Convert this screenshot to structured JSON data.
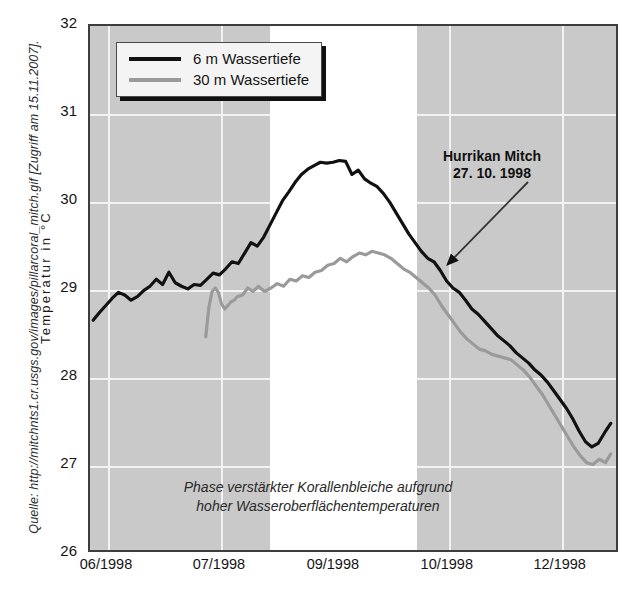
{
  "figure": {
    "title_sliver": "",
    "source_credit": "Quelle: http://mitchnts1.cr.usgs.gov/images/pillarcoral_mitch.gif [Zugriff am 15.11.2007].",
    "y_axis_title": "Temperatur in °C",
    "plot_caption_line1": "Phase verstärkter Korallenbleiche aufgrund",
    "plot_caption_line2": "hoher Wasseroberflächentemperaturen",
    "annotation_line1": "Hurrikan Mitch",
    "annotation_line2": "27. 10. 1998"
  },
  "colors": {
    "plot_background": "#c9c9c9",
    "highlight_band": "#ffffff",
    "gridline": "#f2f2f2",
    "series_6m": "#111111",
    "series_30m": "#9a9a9a",
    "axis_frame": "#3d3d3d",
    "text": "#141414"
  },
  "legend": {
    "position": "top-left-inside",
    "entries": [
      {
        "label": "6 m Wassertiefe",
        "color": "#111111",
        "swatch": "line-swatch-black"
      },
      {
        "label": "30 m Wassertiefe",
        "color": "#9a9a9a",
        "swatch": "line-swatch-gray"
      }
    ]
  },
  "chart_data": {
    "type": "line",
    "title": "",
    "xlabel": "",
    "ylabel": "Temperatur in °C",
    "ylim": [
      26,
      32
    ],
    "yticks": [
      26,
      27,
      28,
      29,
      30,
      31,
      32
    ],
    "xlim": [
      0,
      100
    ],
    "xticks": [
      3.4,
      24.7,
      46.2,
      67.7,
      89.0
    ],
    "xticklabels": [
      "06/1998",
      "07/1998",
      "09/1998",
      "10/1998",
      "12/1998"
    ],
    "grid": true,
    "legend_position": "upper left",
    "annotations": [
      {
        "text": "Hurrikan Mitch\n27. 10. 1998",
        "x": 69.0,
        "y": 30.55,
        "arrow_to_x": 65.5,
        "arrow_to_y": 29.35
      },
      {
        "text": "Phase verstärkter Korallenbleiche aufgrund\nhoher Wasseroberflächentemperaturen",
        "x": 40.0,
        "y": 26.55
      }
    ],
    "shaded_regions": [
      {
        "x_start": 34.0,
        "x_end": 61.7,
        "color": "#ffffff",
        "label": "Phase verstärkter Korallenbleiche"
      }
    ],
    "series": [
      {
        "name": "6 m Wassertiefe",
        "color": "#111111",
        "x": [
          0.6,
          1.8,
          3.0,
          4.2,
          5.4,
          6.6,
          7.8,
          9.0,
          10.2,
          11.4,
          12.6,
          13.8,
          15.0,
          16.2,
          17.4,
          18.6,
          19.8,
          21.0,
          22.2,
          23.4,
          24.6,
          25.8,
          27.0,
          28.2,
          29.4,
          30.6,
          31.8,
          33.0,
          34.2,
          35.4,
          36.6,
          37.8,
          39.0,
          40.2,
          41.4,
          42.6,
          43.8,
          45.0,
          46.2,
          47.4,
          48.6,
          49.8,
          51.0,
          52.2,
          53.4,
          54.6,
          55.8,
          57.0,
          58.2,
          59.4,
          60.6,
          61.8,
          63.0,
          64.2,
          65.4,
          66.6,
          67.8,
          69.0,
          70.2,
          71.4,
          72.6,
          73.8,
          75.0,
          76.2,
          77.4,
          78.6,
          79.8,
          81.0,
          82.2,
          83.4,
          84.6,
          85.8,
          87.0,
          88.2,
          89.4,
          90.6,
          91.8,
          93.0,
          94.2,
          95.4,
          96.6,
          97.8,
          99.0
        ],
        "y": [
          28.63,
          28.72,
          28.8,
          28.88,
          28.95,
          28.92,
          28.86,
          28.9,
          28.97,
          29.02,
          29.1,
          29.04,
          29.18,
          29.06,
          29.02,
          28.99,
          29.04,
          29.03,
          29.1,
          29.17,
          29.15,
          29.22,
          29.3,
          29.28,
          29.4,
          29.52,
          29.48,
          29.58,
          29.72,
          29.86,
          30.0,
          30.1,
          30.21,
          30.3,
          30.36,
          30.4,
          30.44,
          30.43,
          30.44,
          30.46,
          30.45,
          30.3,
          30.35,
          30.25,
          30.2,
          30.16,
          30.08,
          29.98,
          29.86,
          29.74,
          29.62,
          29.52,
          29.42,
          29.34,
          29.3,
          29.2,
          29.08,
          29.0,
          28.95,
          28.86,
          28.76,
          28.7,
          28.62,
          28.54,
          28.46,
          28.4,
          28.34,
          28.26,
          28.2,
          28.14,
          28.06,
          28.0,
          27.92,
          27.82,
          27.72,
          27.62,
          27.5,
          27.36,
          27.24,
          27.18,
          27.22,
          27.34,
          27.45
        ]
      },
      {
        "name": "30 m Wassertiefe",
        "color": "#9a9a9a",
        "x": [
          22.0,
          22.6,
          23.2,
          23.8,
          24.4,
          25.0,
          25.6,
          26.2,
          26.8,
          27.4,
          28.0,
          29.0,
          30.0,
          31.0,
          32.0,
          33.2,
          34.4,
          35.6,
          36.8,
          38.0,
          39.2,
          40.4,
          41.6,
          42.8,
          44.0,
          45.2,
          46.4,
          47.6,
          48.8,
          50.0,
          51.2,
          52.4,
          53.6,
          54.8,
          56.0,
          57.2,
          58.4,
          59.6,
          60.8,
          62.0,
          63.2,
          64.4,
          65.6,
          66.8,
          68.0,
          69.2,
          70.4,
          71.6,
          72.8,
          74.0,
          75.2,
          76.4,
          77.6,
          78.8,
          80.0,
          81.2,
          82.4,
          83.6,
          84.8,
          86.0,
          87.2,
          88.4,
          89.6,
          90.8,
          92.0,
          93.2,
          94.4,
          95.6,
          96.8,
          98.0,
          99.0
        ],
        "y": [
          28.44,
          28.78,
          28.96,
          29.0,
          28.95,
          28.82,
          28.76,
          28.8,
          28.84,
          28.86,
          28.9,
          28.92,
          29.0,
          28.96,
          29.02,
          28.96,
          29.0,
          29.05,
          29.02,
          29.1,
          29.08,
          29.14,
          29.12,
          29.18,
          29.2,
          29.26,
          29.28,
          29.34,
          29.3,
          29.36,
          29.4,
          29.38,
          29.42,
          29.4,
          29.38,
          29.34,
          29.28,
          29.22,
          29.18,
          29.12,
          29.06,
          29.0,
          28.92,
          28.8,
          28.7,
          28.6,
          28.5,
          28.42,
          28.36,
          28.3,
          28.28,
          28.24,
          28.22,
          28.2,
          28.18,
          28.12,
          28.06,
          27.98,
          27.88,
          27.78,
          27.66,
          27.54,
          27.42,
          27.3,
          27.18,
          27.08,
          27.0,
          26.98,
          27.04,
          27.0,
          27.1
        ]
      }
    ]
  }
}
